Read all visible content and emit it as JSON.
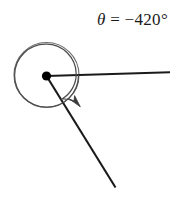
{
  "figure": {
    "label": {
      "theta_symbol": "θ",
      "equals": "=",
      "value": "−420°",
      "full_text": "θ = −420°"
    },
    "colors": {
      "ray_stroke": "#1a1a1a",
      "circle_stroke": "#6b6b6b",
      "arc_stroke": "#4d4d4d",
      "vertex_fill": "#000000",
      "background": "#ffffff",
      "text": "#1a1a1a"
    },
    "geometry": {
      "vertex": {
        "x": 46.5,
        "y": 76
      },
      "circle": {
        "cx": 46.5,
        "cy": 75,
        "r": 32.5
      },
      "initial_ray": {
        "x1": 46.5,
        "y1": 76,
        "x2": 170,
        "y2": 72
      },
      "terminal_ray": {
        "x1": 46.5,
        "y1": 76,
        "x2": 115,
        "y2": 187
      },
      "rotation_direction": "clockwise",
      "rotation_degrees": -420,
      "spiral_arc_radius_start": 32,
      "spiral_arc_radius_end": 26,
      "arrow_tip": {
        "x": 79,
        "y": 106
      }
    },
    "parts": {
      "vertex_name": "vertex-point",
      "initial_side_name": "initial-side-ray",
      "terminal_side_name": "terminal-side-ray",
      "circle_name": "reference-circle",
      "arc_name": "rotation-arc",
      "arrow_name": "rotation-arrowhead"
    }
  }
}
